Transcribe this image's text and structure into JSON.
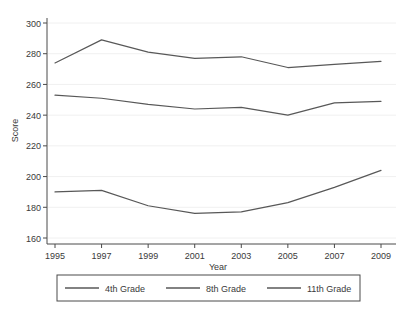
{
  "chart_data": {
    "type": "line",
    "title": "",
    "xlabel": "Year",
    "ylabel": "Score",
    "x": [
      1995,
      1997,
      1999,
      2001,
      2003,
      2005,
      2007,
      2009
    ],
    "xlim": [
      1995,
      2009
    ],
    "ylim": [
      157,
      303
    ],
    "xticks": [
      "1995",
      "1997",
      "1999",
      "2001",
      "2003",
      "2005",
      "2007",
      "2009"
    ],
    "yticks": [
      "160",
      "180",
      "200",
      "220",
      "240",
      "260",
      "280",
      "300"
    ],
    "grid": true,
    "grid_orientation": "horizontal",
    "legend_position": "bottom",
    "series": [
      {
        "name": "4th Grade",
        "values": [
          274,
          289,
          281,
          277,
          278,
          271,
          273,
          275
        ]
      },
      {
        "name": "8th Grade",
        "values": [
          253,
          251,
          247,
          244,
          245,
          240,
          248,
          249
        ]
      },
      {
        "name": "11th Grade",
        "values": [
          190,
          191,
          181,
          176,
          177,
          183,
          193,
          204
        ]
      }
    ]
  },
  "legend": {
    "items": [
      {
        "label": "4th Grade"
      },
      {
        "label": "8th Grade"
      },
      {
        "label": "11th Grade"
      }
    ]
  },
  "axes": {
    "y_title": "Score",
    "x_title": "Year"
  }
}
